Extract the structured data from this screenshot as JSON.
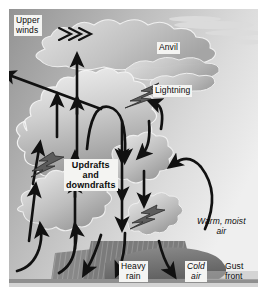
{
  "figure": {
    "background": "#ffffff",
    "sky_top_left": "#9a9a9a",
    "sky_right": "#ececec",
    "cloud_light": "#e9e9e9",
    "cloud_mid": "#c6c6c6",
    "cloud_dark": "#9c9c9c",
    "arrow_color": "#111111",
    "rain_color": "#6e6e6e",
    "cold_air_color": "#7b7b7b",
    "ground_color": "#cfcfcf",
    "label_box": "#f4f4f2"
  },
  "labels": {
    "upper_winds": "Upper\nwinds",
    "anvil": "Anvil",
    "lightning": "Lightning",
    "updrafts": "Updrafts\nand\ndowndrafts",
    "warm_moist_air": "Warm, moist\nair",
    "heavy_rain": "Heavy\nrain",
    "cold_air": "Cold\nair",
    "gust_front": "Gust\nfront"
  },
  "icons": {
    "upper_winds_arrows": "chevron-arrows-icon",
    "lightning_bolt": "lightning-bolt-icon",
    "updraft_arrow": "up-arrow-icon",
    "downdraft_arrow": "down-arrow-icon",
    "inflow_arrow": "curved-inflow-arrow-icon",
    "rain_shaft": "rain-hatch-icon",
    "cold_air_dome": "cold-air-dome-icon",
    "ground_line": "ground-line-icon"
  }
}
